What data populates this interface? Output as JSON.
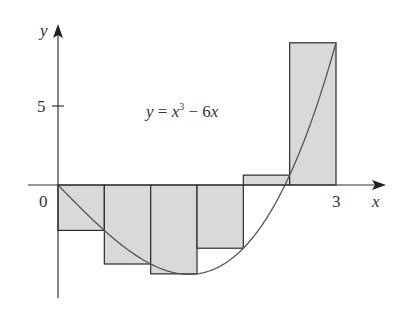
{
  "chart_data": {
    "type": "bar",
    "title": "",
    "subtitle": "Right-endpoint Riemann sum approximation",
    "function_label": {
      "lhs": "y",
      "eq": " = ",
      "x": "x",
      "exp": "3",
      "rest": " − 6",
      "x2": "x"
    },
    "xlabel": "x",
    "ylabel": "y",
    "x_ticks": [
      {
        "value": 0,
        "label": "0"
      },
      {
        "value": 3,
        "label": "3"
      }
    ],
    "y_ticks": [
      {
        "value": 5,
        "label": "5"
      }
    ],
    "xlim": [
      -0.25,
      3.5
    ],
    "ylim": [
      -6.5,
      10
    ],
    "grid": false,
    "legend": null,
    "curve": {
      "expression": "x^3 - 6x",
      "domain": [
        0,
        3
      ]
    },
    "categories": [
      "[0,0.5]",
      "[0.5,1]",
      "[1,1.5]",
      "[1.5,2]",
      "[2,2.5]",
      "[2.5,3]"
    ],
    "x_intervals": [
      [
        0,
        0.5
      ],
      [
        0.5,
        1
      ],
      [
        1,
        1.5
      ],
      [
        1.5,
        2
      ],
      [
        2,
        2.5
      ],
      [
        2.5,
        3
      ]
    ],
    "values": [
      -2.875,
      -5,
      -5.625,
      -4,
      0.625,
      9
    ],
    "colors": {
      "rect_fill": "#d9d9d9",
      "rect_stroke": "#2b2b2b",
      "axis": "#333333",
      "curve": "#555555"
    }
  }
}
